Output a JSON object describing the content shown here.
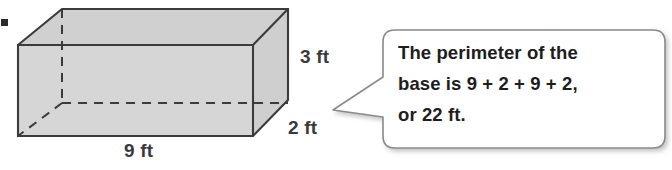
{
  "figure": {
    "bullet_marker": "▪",
    "solid": {
      "shape_name": "rectangular-prism",
      "faces_fill": "#d4d4d4",
      "top_face_fill": "#d0d0d0",
      "edge_color": "#3b3b3b",
      "hidden_edge_style": "dashed",
      "dimensions": {
        "length_label": "9 ft",
        "height_label": "3 ft",
        "depth_label": "2 ft"
      }
    }
  },
  "callout": {
    "border_color": "#8a8a8a",
    "fill_color": "#ffffff",
    "lines": [
      "The perimeter of the",
      "base is 9 + 2 + 9 + 2,",
      "or 22 ft."
    ],
    "full_text": "The perimeter of the base is 9 + 2 + 9 + 2, or 22 ft."
  }
}
